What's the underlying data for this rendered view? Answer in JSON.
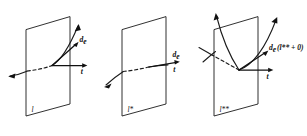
{
  "figure": {
    "name": "transversality-three-panel-diagram",
    "width": 307,
    "height": 136,
    "background_color": "#ffffff",
    "ink_color": "#111111",
    "panel_count": 3
  },
  "panels": [
    {
      "id": "panel-1",
      "plane_label": "l",
      "case": "transversal-crossing",
      "labels": {
        "vector_d": "d",
        "vector_d_subscript": "e",
        "vector_t": "t"
      },
      "curve_description": "curve enters from lower left, hidden (dashed) behind plane, crosses plane at contact point, exits upward to the right",
      "arrows": [
        {
          "name": "d_e-vector",
          "direction": "up-right",
          "angle_deg": 35
        },
        {
          "name": "t-vector",
          "direction": "right",
          "angle_deg": 0
        },
        {
          "name": "curve-forward-arrow",
          "direction": "up-right",
          "angle_deg": 60
        },
        {
          "name": "curve-backward-arrow",
          "direction": "left",
          "angle_deg": 195
        }
      ]
    },
    {
      "id": "panel-2",
      "plane_label": "l*",
      "case": "tangential-contact",
      "labels": {
        "vector_d": "d",
        "vector_d_subscript": "e",
        "vector_t": "t"
      },
      "curve_description": "curve is tangent to the plane; d_e and t coincide along the horizontal direction",
      "arrows": [
        {
          "name": "d_e-and-t-vector",
          "direction": "right",
          "angle_deg": 0
        },
        {
          "name": "curve-backward-arrow",
          "direction": "down-left",
          "angle_deg": 225
        }
      ]
    },
    {
      "id": "panel-3",
      "plane_label": "l**",
      "case": "cusp-reflection",
      "labels": {
        "vector_d": "d",
        "vector_d_subscript": "e",
        "vector_d_argument": "(l** + 0)",
        "vector_t": "t"
      },
      "curve_description": "curve forms a cusp (V shape) at the contact point with branches rising on both sides of the plane",
      "arrows": [
        {
          "name": "d_e-vector",
          "direction": "up-right",
          "angle_deg": 28
        },
        {
          "name": "t-vector",
          "direction": "right",
          "angle_deg": 0
        },
        {
          "name": "curve-left-branch-arrow",
          "direction": "up",
          "angle_deg": 85
        },
        {
          "name": "curve-right-branch-arrow",
          "direction": "up-right",
          "angle_deg": 62
        }
      ]
    }
  ],
  "legend": {
    "symbols": [
      {
        "symbol": "d_e",
        "meaning": "effective direction vector"
      },
      {
        "symbol": "t",
        "meaning": "tangent vector to the plane"
      },
      {
        "symbol": "l",
        "meaning": "plane label panel one"
      },
      {
        "symbol": "l*",
        "meaning": "plane label panel two"
      },
      {
        "symbol": "l**",
        "meaning": "plane label panel three"
      }
    ]
  }
}
